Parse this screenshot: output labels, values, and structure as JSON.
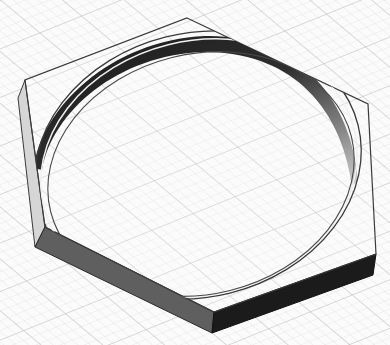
{
  "scene": {
    "description": "Isometric 3D render of a hexagonal plate with a circular ring recess on a grid ground plane",
    "colors": {
      "background": "#fbfbfb",
      "grid_line": "#c9c9c9",
      "grid_line_minor": "#e2e2e2",
      "outline": "#3a3a3a",
      "front_left_face": "#5e5e5e",
      "front_right_face": "#1c1c1c",
      "left_side_face": "#d0d0d0",
      "ring_inner_dark": "#2a2a2a",
      "ring_inner_mid": "#7a7a7a",
      "ring_highlight": "#e8e8e8"
    },
    "hexagon_top_face": [
      [
        187,
        18
      ],
      [
        368,
        104
      ],
      [
        376,
        254
      ],
      [
        214,
        312
      ],
      [
        45,
        227
      ],
      [
        25,
        80
      ]
    ],
    "extrusion_offset": [
      -2,
      21
    ]
  }
}
